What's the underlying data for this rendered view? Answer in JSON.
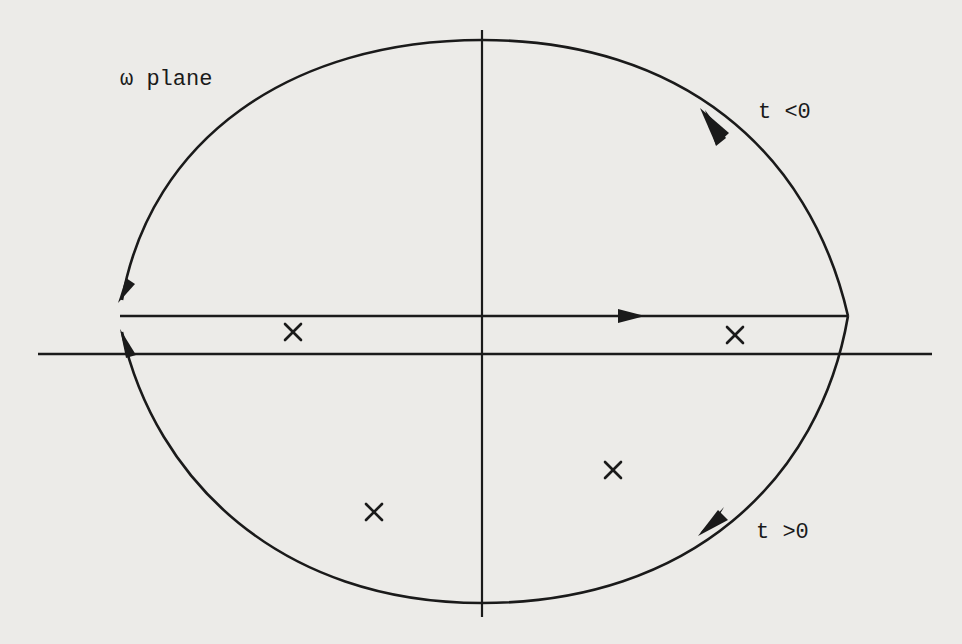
{
  "diagram": {
    "title": "ω plane",
    "labels": {
      "plane": "ω plane",
      "upper_arc": "t <0",
      "lower_arc": "t >0"
    },
    "poles": [
      {
        "id": "pole-1",
        "symbol": "×",
        "x": 293,
        "y": 332
      },
      {
        "id": "pole-2",
        "symbol": "×",
        "x": 735,
        "y": 335
      },
      {
        "id": "pole-3",
        "symbol": "×",
        "x": 613,
        "y": 470
      },
      {
        "id": "pole-4",
        "symbol": "×",
        "x": 374,
        "y": 512
      }
    ],
    "colors": {
      "ink": "#1a1a1a",
      "paper": "#ecebe8"
    }
  }
}
